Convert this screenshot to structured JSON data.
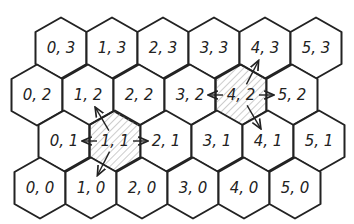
{
  "diagram": {
    "type": "hex-grid-neighbors",
    "colors": {
      "line": "#222222",
      "background": "#ffffff",
      "hatch": "#999999"
    },
    "hex": {
      "width": 51,
      "row_height": 46.5
    },
    "rows": [
      {
        "r": 3,
        "y": 48,
        "x0": 61,
        "cells": [
          "0, 3",
          "1, 3",
          "2, 3",
          "3, 3",
          "4, 3",
          "5, 3"
        ]
      },
      {
        "r": 2,
        "y": 95,
        "x0": 37,
        "cells": [
          "0, 2",
          "1, 2",
          "2, 2",
          "3, 2",
          "4, 2",
          "5, 2"
        ]
      },
      {
        "r": 1,
        "y": 141,
        "x0": 64,
        "cells": [
          "0, 1",
          "1, 1",
          "2, 1",
          "3, 1",
          "4, 1",
          "5, 1"
        ]
      },
      {
        "r": 0,
        "y": 188,
        "x0": 40,
        "cells": [
          "0, 0",
          "1, 0",
          "2, 0",
          "3, 0",
          "4, 0",
          "5, 0"
        ]
      }
    ],
    "highlighted": [
      {
        "cell": "1, 1",
        "neighbors": [
          "0, 1",
          "2, 1",
          "1, 2",
          "1, 0"
        ]
      },
      {
        "cell": "4, 2",
        "neighbors": [
          "3, 2",
          "5, 2",
          "4, 3",
          "4, 1"
        ]
      }
    ]
  }
}
